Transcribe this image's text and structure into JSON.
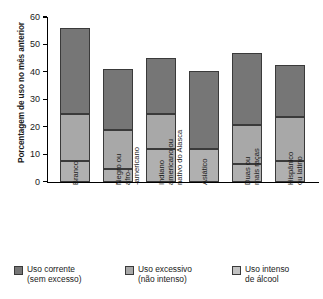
{
  "chart_data": {
    "type": "bar",
    "stacked": true,
    "title": "",
    "xlabel": "",
    "ylabel": "Porcentagem de uso no mês anterior",
    "ylim": [
      0,
      60
    ],
    "yticks": [
      0,
      10,
      20,
      30,
      40,
      50,
      60
    ],
    "ytick_labels": [
      "0",
      "10",
      "20",
      "30",
      "40",
      "50",
      "60"
    ],
    "grid": false,
    "legend_position": "bottom",
    "categories": [
      "Branco",
      "Negro ou afro-americano",
      "Indiano americano ou nativo do Alasca",
      "Asiático",
      "Duas ou mais raças",
      "Hispânico ou latino"
    ],
    "category_lines": [
      [
        "Branco"
      ],
      [
        "Negro ou",
        "afro-",
        "-americano"
      ],
      [
        "Indiano",
        "americano ou",
        "nativo do Alasca"
      ],
      [
        "Asiático"
      ],
      [
        "Duas ou",
        "mais raças"
      ],
      [
        "Hispânico",
        "ou latino"
      ]
    ],
    "series": [
      {
        "name": "Uso intenso de álcool",
        "name_lines": [
          "Uso intenso",
          "de álcool"
        ],
        "color": "#b0b0b0",
        "values": [
          7.5,
          4.5,
          12,
          12,
          6.5,
          7.5
        ]
      },
      {
        "name": "Uso excessivo (não intenso)",
        "name_lines": [
          "Uso excessivo",
          "(não intenso)"
        ],
        "color": "#a8a8a8",
        "values": [
          17,
          14.5,
          12.5,
          0,
          14,
          16
        ]
      },
      {
        "name": "Uso corrente (sem excesso)",
        "name_lines": [
          "Uso corrente",
          "(sem excesso)"
        ],
        "color": "#767676",
        "values": [
          31.5,
          22,
          20.5,
          28.5,
          26.5,
          19
        ]
      }
    ],
    "totals": [
      56,
      41,
      45,
      40.5,
      47,
      42.5
    ],
    "boundaries": [
      [
        7.5,
        24.5,
        56
      ],
      [
        4.5,
        19,
        41
      ],
      [
        12,
        24.5,
        45
      ],
      [
        12,
        12,
        40.5
      ],
      [
        6.5,
        20.5,
        47
      ],
      [
        7.5,
        23.5,
        42.5
      ]
    ]
  },
  "legend": [
    {
      "line1": "Uso corrente",
      "line2": "(sem excesso)",
      "color": "#767676"
    },
    {
      "line1": "Uso excessivo",
      "line2": "(não intenso)",
      "color": "#a8a8a8"
    },
    {
      "line1": "Uso intenso",
      "line2": "de álcool",
      "color": "#c2c2c2"
    }
  ]
}
